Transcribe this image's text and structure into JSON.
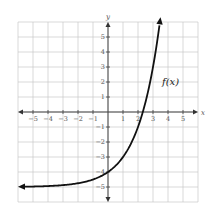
{
  "chart_data": {
    "type": "line",
    "title": "",
    "xlabel": "x",
    "ylabel": "y",
    "xlim": [
      -6,
      6
    ],
    "ylim": [
      -6,
      6
    ],
    "grid": true,
    "x_ticks": [
      -5,
      -4,
      -3,
      -2,
      -1,
      1,
      2,
      3,
      4,
      5
    ],
    "y_ticks": [
      -5,
      -4,
      -3,
      -2,
      -1,
      1,
      2,
      3,
      4,
      5
    ],
    "series": [
      {
        "name": "f(x)",
        "description": "exponential curve, f(x) = 2^x - 5, arrows at both ends",
        "x": [
          -6,
          -5,
          -4,
          -3,
          -2,
          -1,
          0,
          1,
          2,
          2.32,
          3,
          3.4
        ],
        "y": [
          -4.98,
          -4.97,
          -4.94,
          -4.88,
          -4.75,
          -4.5,
          -4,
          -3,
          -1,
          0,
          3,
          5.56
        ]
      }
    ],
    "annotations": [
      {
        "text": "f(x)",
        "x": 3.6,
        "y": 2
      }
    ],
    "asymptote": {
      "y": -5
    }
  },
  "labels": {
    "x_axis": "x",
    "y_axis": "y",
    "function": "f(x)"
  }
}
